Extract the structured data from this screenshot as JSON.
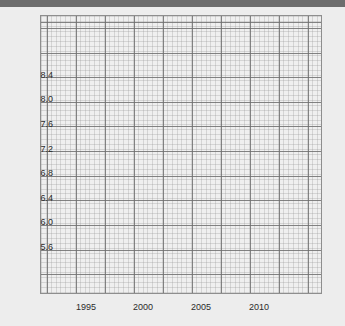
{
  "figure": {
    "background_color": "#ededed",
    "plot_background_color": "#efefef",
    "top_band_color": "#6d6d6d",
    "axis_border_color": "#8e8e8e",
    "major_grid_color": "#6e6e6e",
    "minor_grid_color": "#969696",
    "tick_label_color": "#2b2b2b"
  },
  "chart_data": {
    "type": "line",
    "title": "",
    "subtitle": "",
    "xlabel": "",
    "ylabel": "",
    "grid": true,
    "minor_grid": true,
    "legend": false,
    "legend_position": "none",
    "annotations": [],
    "series": [],
    "x": [],
    "values": [],
    "xlim": [
      1992.75,
      2012.5
    ],
    "ylim": [
      5.38,
      8.72
    ],
    "xticks": [
      1995,
      2000,
      2005,
      2010
    ],
    "xtick_labels": [
      "1995",
      "2000",
      "2005",
      "2010"
    ],
    "yticks": [
      5.6,
      6.0,
      6.4,
      6.8,
      7.2,
      7.6,
      8.0,
      8.4
    ],
    "ytick_labels": [
      "5.6",
      "6.0",
      "6.4",
      "6.8",
      "7.2",
      "7.6",
      "8.0",
      "8.4"
    ],
    "note": "Empty plot: axes, grid and tick labels only; no data series drawn."
  },
  "axes": {
    "y_ticks": [
      {
        "label": "8.4",
        "top": 64
      },
      {
        "label": "8.0",
        "top": 88
      },
      {
        "label": "7.6",
        "top": 113
      },
      {
        "label": "7.2",
        "top": 138
      },
      {
        "label": "6.8",
        "top": 162
      },
      {
        "label": "6.4",
        "top": 187
      },
      {
        "label": "6.0",
        "top": 211
      },
      {
        "label": "5.6",
        "top": 236
      }
    ],
    "x_ticks": [
      {
        "label": "1995",
        "left": 86
      },
      {
        "label": "2000",
        "left": 143
      },
      {
        "label": "2005",
        "left": 201
      },
      {
        "label": "2010",
        "left": 259
      }
    ]
  }
}
